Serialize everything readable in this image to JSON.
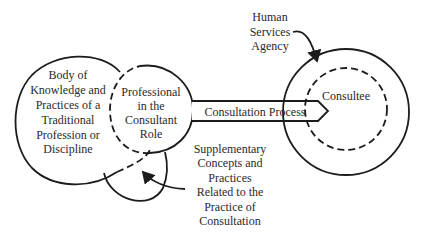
{
  "diagram": {
    "type": "consultation-model",
    "nodes": {
      "body_of_knowledge": {
        "lines": [
          "Body of",
          "Knowledge and",
          "Practices of a",
          "Traditional",
          "Profession or",
          "Discipline"
        ]
      },
      "professional": {
        "lines": [
          "Professional",
          "in the",
          "Consultant",
          "Role"
        ]
      },
      "process": {
        "label": "Consultation Process"
      },
      "consultee": {
        "label": "Consultee"
      },
      "agency": {
        "lines": [
          "Human",
          "Services",
          "Agency"
        ]
      },
      "supplementary": {
        "lines": [
          "Supplementary",
          "Concepts and",
          "Practices",
          "Related to the",
          "Practice of",
          "Consultation"
        ]
      }
    },
    "colors": {
      "line": "#1c1c1c",
      "text": "#2a2a2a",
      "background": "#ffffff"
    }
  }
}
